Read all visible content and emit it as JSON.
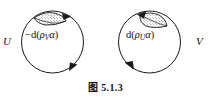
{
  "figure": {
    "caption": "图 5.1.3",
    "background_color": "#ffffff",
    "stroke_color": "#1a1a1a"
  },
  "left_circle": {
    "side_label": "U",
    "form_label": {
      "sign": "−",
      "operator": "d",
      "open_paren": "(",
      "rho": "ρ",
      "subscript": "V",
      "alpha": "α",
      "close_paren": ")",
      "full_text": "−d(ρ_V α)"
    },
    "orientation": "clockwise",
    "arrow_count": 2,
    "cap_region": "stippled-lens"
  },
  "right_circle": {
    "side_label": "V",
    "form_label": {
      "sign": "",
      "operator": "d",
      "open_paren": "(",
      "rho": "ρ",
      "subscript": "U",
      "alpha": "α",
      "close_paren": ")",
      "full_text": "d(ρ_U α)"
    },
    "orientation": "counterclockwise",
    "arrow_count": 2,
    "cap_region": "stippled-lens"
  }
}
